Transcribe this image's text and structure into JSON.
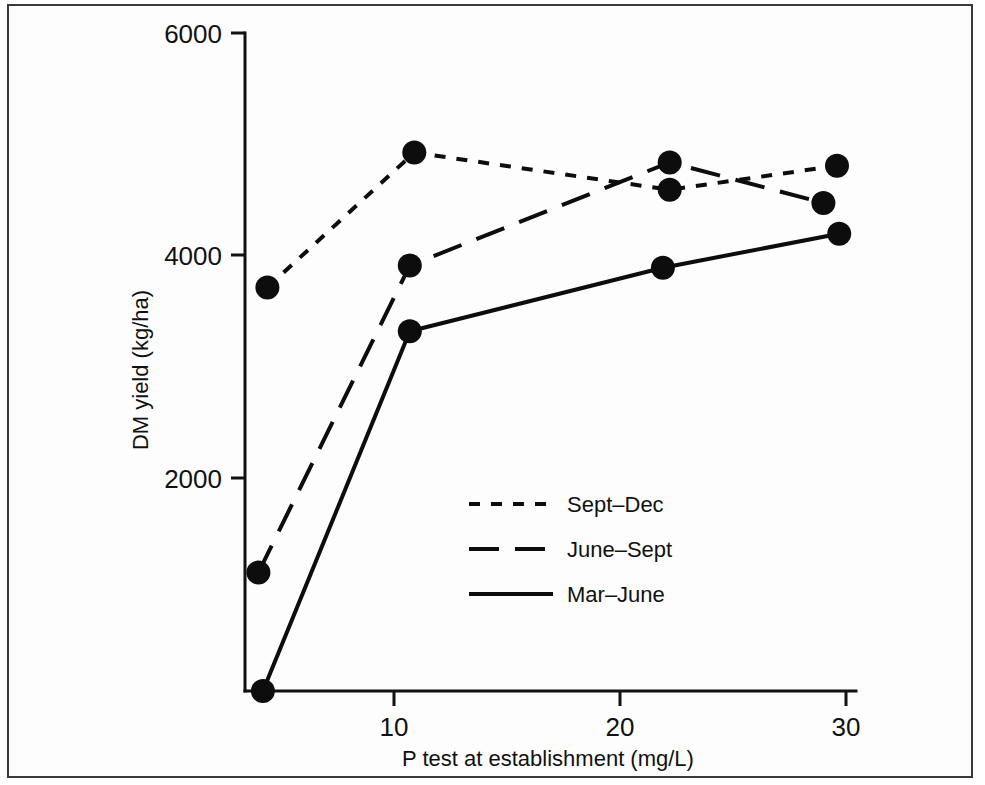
{
  "chart_data": {
    "type": "line",
    "title": "",
    "xlabel": "P test at establishment (mg/L)",
    "ylabel": "DM yield (kg/ha)",
    "xlim": [
      0,
      31
    ],
    "ylim": [
      0,
      6000
    ],
    "grid": false,
    "legend_position": "center",
    "xticks": [
      10,
      20,
      30
    ],
    "xtick_labels": [
      "10",
      "20",
      "30"
    ],
    "yticks": [
      2000,
      4000,
      6000
    ],
    "ytick_labels": [
      "2000",
      "4000",
      "6000"
    ],
    "series": [
      {
        "name": "Sept–Dec",
        "style": "short-dashed",
        "marker": "filled-circle",
        "x": [
          4.4,
          10.9,
          22.2,
          29.6
        ],
        "values": [
          3680,
          4910,
          4570,
          4790
        ]
      },
      {
        "name": "June–Sept",
        "style": "long-dashed",
        "marker": "filled-circle",
        "x": [
          4.0,
          10.7,
          22.2,
          29.0
        ],
        "values": [
          1080,
          3880,
          4820,
          4450
        ]
      },
      {
        "name": "Mar–June",
        "style": "solid",
        "marker": "filled-circle",
        "x": [
          4.2,
          10.7,
          21.9,
          29.7
        ],
        "values": [
          0,
          3280,
          3860,
          4170
        ]
      }
    ]
  },
  "axes": {
    "x_title": "P test at establishment (mg/L)",
    "y_title": "DM yield (kg/ha)",
    "x_tick_0": "10",
    "x_tick_1": "20",
    "x_tick_2": "30",
    "y_tick_0": "2000",
    "y_tick_1": "4000",
    "y_tick_2": "6000"
  },
  "legend": {
    "entries": [
      {
        "label": "Sept–Dec"
      },
      {
        "label": "June–Sept"
      },
      {
        "label": "Mar–June"
      }
    ]
  },
  "colors": {
    "ink": "#0d0d0d",
    "frame": "#3a3a3a",
    "background": "#ffffff"
  }
}
